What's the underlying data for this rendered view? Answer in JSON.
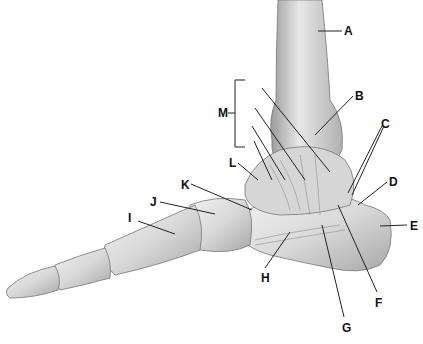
{
  "diagram": {
    "labels": [
      {
        "id": "A",
        "text": "A",
        "x": 344,
        "y": 26
      },
      {
        "id": "B",
        "text": "B",
        "x": 355,
        "y": 91
      },
      {
        "id": "C",
        "text": "C",
        "x": 381,
        "y": 118
      },
      {
        "id": "D",
        "text": "D",
        "x": 389,
        "y": 176
      },
      {
        "id": "E",
        "text": "E",
        "x": 409,
        "y": 220
      },
      {
        "id": "F",
        "text": "F",
        "x": 375,
        "y": 297
      },
      {
        "id": "G",
        "text": "G",
        "x": 342,
        "y": 322
      },
      {
        "id": "H",
        "text": "H",
        "x": 260,
        "y": 272
      },
      {
        "id": "I",
        "text": "I",
        "x": 127,
        "y": 212
      },
      {
        "id": "J",
        "text": "J",
        "x": 150,
        "y": 196
      },
      {
        "id": "K",
        "text": "K",
        "x": 182,
        "y": 179
      },
      {
        "id": "L",
        "text": "L",
        "x": 229,
        "y": 157
      },
      {
        "id": "M",
        "text": "M",
        "x": 219,
        "y": 110
      }
    ]
  }
}
